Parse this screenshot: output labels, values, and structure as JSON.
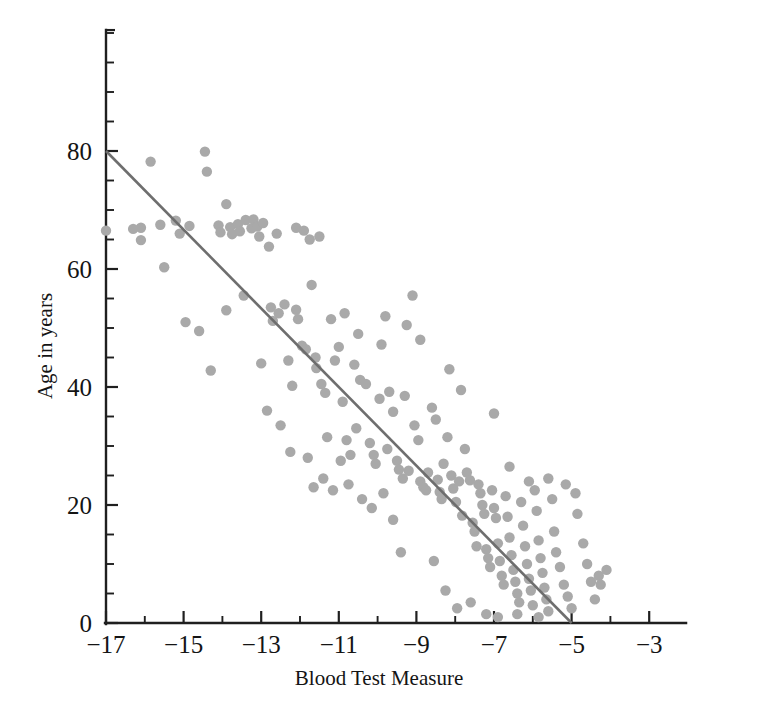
{
  "chart_data": {
    "type": "scatter",
    "title": "",
    "xlabel": "Blood Test Measure",
    "ylabel": "Age in years",
    "xlim": [
      -17.6,
      -2.0
    ],
    "ylim": [
      0,
      101
    ],
    "x_major_ticks": [
      -17,
      -15,
      -13,
      -11,
      -9,
      -7,
      -5,
      -3
    ],
    "x_major_tick_labels": [
      "−17",
      "−15",
      "−13",
      "−11",
      "−9",
      "−7",
      "−5",
      "−3"
    ],
    "x_minor_tick_step": 1,
    "y_major_ticks": [
      0,
      20,
      40,
      60,
      80
    ],
    "y_major_tick_labels": [
      "0",
      "20",
      "40",
      "60",
      "80"
    ],
    "y_minor_tick_step": 5,
    "grid": false,
    "legend": null,
    "point_color": "#a9a9a9",
    "point_radius": 5.2,
    "line_color": "#6e6e6e",
    "line_width": 2.6,
    "axis_color": "#1f1f1f",
    "fit_line": {
      "label": "regression line",
      "x_start": -17,
      "y_start": 80,
      "x_end": -5,
      "y_end": 0,
      "slope": -6.667,
      "intercept": -33.33
    },
    "points": [
      [
        -17.0,
        66.5
      ],
      [
        -16.1,
        67.0
      ],
      [
        -16.1,
        64.9
      ],
      [
        -15.85,
        78.2
      ],
      [
        -15.5,
        60.3
      ],
      [
        -15.2,
        68.2
      ],
      [
        -15.1,
        66.0
      ],
      [
        -14.85,
        67.3
      ],
      [
        -14.6,
        49.5
      ],
      [
        -14.45,
        79.9
      ],
      [
        -14.4,
        76.5
      ],
      [
        -14.3,
        42.8
      ],
      [
        -14.1,
        67.4
      ],
      [
        -14.05,
        66.2
      ],
      [
        -13.9,
        71.0
      ],
      [
        -13.8,
        67.1
      ],
      [
        -13.75,
        65.9
      ],
      [
        -13.6,
        67.6
      ],
      [
        -13.55,
        66.4
      ],
      [
        -13.45,
        55.5
      ],
      [
        -13.4,
        68.3
      ],
      [
        -13.25,
        66.9
      ],
      [
        -13.2,
        68.4
      ],
      [
        -13.1,
        67.2
      ],
      [
        -13.05,
        65.5
      ],
      [
        -12.95,
        67.8
      ],
      [
        -12.8,
        63.8
      ],
      [
        -12.75,
        53.5
      ],
      [
        -12.7,
        51.2
      ],
      [
        -12.55,
        52.5
      ],
      [
        -12.4,
        54.0
      ],
      [
        -12.3,
        44.5
      ],
      [
        -12.2,
        40.2
      ],
      [
        -12.1,
        53.1
      ],
      [
        -12.05,
        51.5
      ],
      [
        -11.95,
        47.0
      ],
      [
        -11.85,
        46.4
      ],
      [
        -11.7,
        57.3
      ],
      [
        -11.6,
        45.0
      ],
      [
        -11.58,
        43.2
      ],
      [
        -11.45,
        40.5
      ],
      [
        -11.35,
        39.0
      ],
      [
        -11.2,
        51.5
      ],
      [
        -11.1,
        44.5
      ],
      [
        -11.0,
        46.8
      ],
      [
        -10.9,
        37.5
      ],
      [
        -10.8,
        31.0
      ],
      [
        -10.7,
        28.5
      ],
      [
        -10.6,
        43.8
      ],
      [
        -10.5,
        49.0
      ],
      [
        -10.45,
        41.2
      ],
      [
        -10.3,
        40.5
      ],
      [
        -10.2,
        30.5
      ],
      [
        -10.1,
        28.5
      ],
      [
        -10.05,
        27.0
      ],
      [
        -9.95,
        38.0
      ],
      [
        -9.9,
        47.2
      ],
      [
        -9.8,
        52.0
      ],
      [
        -9.7,
        39.2
      ],
      [
        -9.6,
        35.8
      ],
      [
        -9.5,
        27.5
      ],
      [
        -9.45,
        26.0
      ],
      [
        -9.35,
        24.5
      ],
      [
        -9.3,
        38.5
      ],
      [
        -9.2,
        25.8
      ],
      [
        -9.1,
        55.5
      ],
      [
        -9.05,
        33.5
      ],
      [
        -8.95,
        31.0
      ],
      [
        -8.9,
        24.0
      ],
      [
        -8.82,
        23.0
      ],
      [
        -8.75,
        22.5
      ],
      [
        -8.7,
        25.5
      ],
      [
        -8.6,
        36.5
      ],
      [
        -8.5,
        34.5
      ],
      [
        -8.45,
        24.3
      ],
      [
        -8.4,
        22.2
      ],
      [
        -8.35,
        21.0
      ],
      [
        -8.3,
        27.0
      ],
      [
        -8.2,
        31.5
      ],
      [
        -8.1,
        25.0
      ],
      [
        -8.05,
        22.8
      ],
      [
        -7.98,
        20.5
      ],
      [
        -7.9,
        24.0
      ],
      [
        -7.82,
        18.2
      ],
      [
        -7.75,
        29.5
      ],
      [
        -7.7,
        25.5
      ],
      [
        -7.62,
        24.2
      ],
      [
        -7.55,
        17.0
      ],
      [
        -7.5,
        15.5
      ],
      [
        -7.45,
        13.0
      ],
      [
        -7.4,
        23.5
      ],
      [
        -7.35,
        22.0
      ],
      [
        -7.3,
        20.0
      ],
      [
        -7.25,
        18.5
      ],
      [
        -7.2,
        12.5
      ],
      [
        -7.15,
        11.0
      ],
      [
        -7.1,
        9.5
      ],
      [
        -7.05,
        22.5
      ],
      [
        -7.0,
        19.5
      ],
      [
        -6.95,
        17.8
      ],
      [
        -6.9,
        13.5
      ],
      [
        -6.85,
        10.5
      ],
      [
        -6.8,
        8.0
      ],
      [
        -6.75,
        6.5
      ],
      [
        -6.7,
        21.5
      ],
      [
        -6.65,
        18.0
      ],
      [
        -6.6,
        14.5
      ],
      [
        -6.55,
        11.5
      ],
      [
        -6.5,
        9.0
      ],
      [
        -6.45,
        7.0
      ],
      [
        -6.4,
        5.0
      ],
      [
        -6.35,
        3.5
      ],
      [
        -6.3,
        20.5
      ],
      [
        -6.25,
        16.5
      ],
      [
        -6.2,
        13.0
      ],
      [
        -6.15,
        10.0
      ],
      [
        -6.1,
        7.5
      ],
      [
        -6.05,
        5.5
      ],
      [
        -6.0,
        3.0
      ],
      [
        -5.95,
        22.5
      ],
      [
        -5.9,
        19.0
      ],
      [
        -5.85,
        14.0
      ],
      [
        -5.8,
        11.0
      ],
      [
        -5.75,
        8.5
      ],
      [
        -5.7,
        6.0
      ],
      [
        -5.65,
        4.0
      ],
      [
        -5.6,
        2.0
      ],
      [
        -5.5,
        21.0
      ],
      [
        -5.45,
        15.5
      ],
      [
        -5.4,
        12.0
      ],
      [
        -5.3,
        9.5
      ],
      [
        -5.2,
        6.5
      ],
      [
        -5.1,
        4.5
      ],
      [
        -5.0,
        2.5
      ],
      [
        -4.9,
        22.0
      ],
      [
        -4.85,
        18.5
      ],
      [
        -4.7,
        13.5
      ],
      [
        -4.6,
        10.0
      ],
      [
        -4.5,
        7.0
      ],
      [
        -4.4,
        4.0
      ],
      [
        -4.3,
        8.0
      ],
      [
        -4.25,
        6.5
      ],
      [
        -4.1,
        9.0
      ],
      [
        -12.6,
        66.0
      ],
      [
        -12.1,
        67.0
      ],
      [
        -11.9,
        66.5
      ],
      [
        -11.75,
        65.0
      ],
      [
        -11.5,
        65.5
      ],
      [
        -11.3,
        31.5
      ],
      [
        -10.95,
        27.5
      ],
      [
        -10.85,
        52.5
      ],
      [
        -9.25,
        50.5
      ],
      [
        -8.9,
        48.0
      ],
      [
        -8.15,
        43.0
      ],
      [
        -7.85,
        39.5
      ],
      [
        -7.0,
        35.5
      ],
      [
        -6.6,
        26.5
      ],
      [
        -6.1,
        24.0
      ],
      [
        -5.6,
        24.5
      ],
      [
        -5.15,
        23.5
      ],
      [
        -13.9,
        53.0
      ],
      [
        -13.0,
        44.0
      ],
      [
        -12.85,
        36.0
      ],
      [
        -12.5,
        33.5
      ],
      [
        -10.55,
        33.0
      ],
      [
        -9.75,
        29.5
      ],
      [
        -9.4,
        12.0
      ],
      [
        -8.55,
        10.5
      ],
      [
        -8.25,
        5.5
      ],
      [
        -7.95,
        2.5
      ],
      [
        -7.6,
        3.5
      ],
      [
        -7.2,
        1.5
      ],
      [
        -6.9,
        1.0
      ],
      [
        -6.4,
        1.5
      ],
      [
        -5.85,
        1.0
      ],
      [
        -11.65,
        23.0
      ],
      [
        -11.4,
        24.5
      ],
      [
        -11.15,
        22.5
      ],
      [
        -10.75,
        23.5
      ],
      [
        -10.4,
        21.0
      ],
      [
        -10.15,
        19.5
      ],
      [
        -9.85,
        22.0
      ],
      [
        -9.6,
        17.5
      ],
      [
        -12.25,
        29.0
      ],
      [
        -11.8,
        28.0
      ],
      [
        -16.3,
        66.8
      ],
      [
        -15.6,
        67.5
      ],
      [
        -14.95,
        51.0
      ]
    ]
  }
}
